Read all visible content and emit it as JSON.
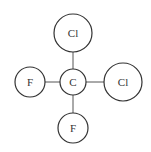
{
  "diagram": {
    "molecule": "CF2Cl2",
    "atoms": [
      {
        "id": "cl_top",
        "label": "Cl",
        "cx": 73,
        "cy": 33,
        "r": 19
      },
      {
        "id": "c_center",
        "label": "C",
        "cx": 73,
        "cy": 82,
        "r": 13
      },
      {
        "id": "f_left",
        "label": "F",
        "cx": 30,
        "cy": 82,
        "r": 15
      },
      {
        "id": "cl_right",
        "label": "Cl",
        "cx": 123,
        "cy": 82,
        "r": 19
      },
      {
        "id": "f_bottom",
        "label": "F",
        "cx": 73,
        "cy": 128,
        "r": 15
      }
    ],
    "bonds": [
      [
        "c_center",
        "cl_top"
      ],
      [
        "c_center",
        "f_left"
      ],
      [
        "c_center",
        "cl_right"
      ],
      [
        "c_center",
        "f_bottom"
      ]
    ],
    "colors": {
      "stroke": "#333333",
      "bond": "#555555",
      "fill": "#ffffff"
    }
  }
}
